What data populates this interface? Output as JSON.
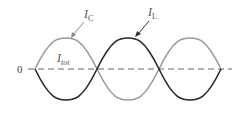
{
  "diagram": {
    "title": "",
    "labels": {
      "zero": "0",
      "ic_main": "I",
      "ic_sub": "C",
      "il_main": "I",
      "il_sub": "L",
      "itot_main": "I",
      "itot_sub": "tot"
    },
    "colors": {
      "ic_curve": "#9a9a9a",
      "il_curve": "#2a2a2a",
      "axis": "#666666"
    },
    "curves": [
      {
        "name": "I_C",
        "description": "capacitor current, starts positive half-cycle",
        "color": "#9a9a9a"
      },
      {
        "name": "I_L",
        "description": "inductor current, 180° out of phase with I_C",
        "color": "#2a2a2a"
      },
      {
        "name": "I_tot",
        "description": "total current, zero (dashed line)"
      }
    ]
  }
}
